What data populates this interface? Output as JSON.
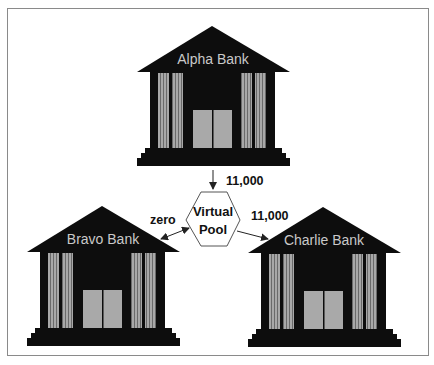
{
  "diagram": {
    "title": "",
    "colors": {
      "building": "#0d0d0d",
      "column": "#a8a8a8",
      "column_stripe": "#6a6a6a",
      "door": "#a9a9a9",
      "label": "#cfcfcf",
      "frame": "#8a8a8a",
      "arrow": "#222222",
      "hexagon_stroke": "#555555"
    },
    "banks": [
      {
        "id": "alpha",
        "label": "Alpha Bank",
        "icon": "bank-building-icon"
      },
      {
        "id": "bravo",
        "label": "Bravo Bank",
        "icon": "bank-building-icon"
      },
      {
        "id": "charlie",
        "label": "Charlie Bank",
        "icon": "bank-building-icon"
      }
    ],
    "pool": {
      "line1": "Virtual",
      "line2": "Pool",
      "shape": "hexagon"
    },
    "flows": [
      {
        "from": "Alpha Bank",
        "to": "Virtual Pool",
        "amount": "11,000",
        "direction": "one-way"
      },
      {
        "from": "Virtual Pool",
        "to": "Bravo Bank",
        "amount": "zero",
        "direction": "two-way"
      },
      {
        "from": "Virtual Pool",
        "to": "Charlie Bank",
        "amount": "11,000",
        "direction": "one-way"
      }
    ]
  }
}
